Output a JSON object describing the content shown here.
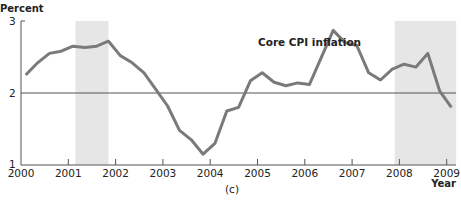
{
  "chart_data": {
    "type": "line",
    "title": "",
    "ylabel": "Percent",
    "xlabel": "Year",
    "caption": "(c)",
    "annotation": "Core CPI inflation",
    "ylim": [
      1,
      3
    ],
    "xlim": [
      2000,
      2009.2
    ],
    "yticks": [
      1,
      2,
      3
    ],
    "xticks": [
      2000,
      2001,
      2002,
      2003,
      2004,
      2005,
      2006,
      2007,
      2008,
      2009
    ],
    "reference_line": 2,
    "shaded_regions": [
      {
        "start": 2001.15,
        "end": 2001.85
      },
      {
        "start": 2007.9,
        "end": 2009.2
      }
    ],
    "colors": {
      "line": "#7a7a7a",
      "shade": "#e6e6e6",
      "axis": "#555555",
      "refline": "#555555"
    },
    "series": [
      {
        "name": "Core CPI inflation",
        "x": [
          2000.1,
          2000.35,
          2000.6,
          2000.85,
          2001.1,
          2001.35,
          2001.6,
          2001.85,
          2002.1,
          2002.35,
          2002.6,
          2002.85,
          2003.1,
          2003.35,
          2003.6,
          2003.85,
          2004.1,
          2004.35,
          2004.6,
          2004.85,
          2005.1,
          2005.35,
          2005.6,
          2005.85,
          2006.1,
          2006.6,
          2006.85,
          2007.1,
          2007.35,
          2007.6,
          2007.85,
          2008.1,
          2008.35,
          2008.6,
          2008.85,
          2009.1
        ],
        "values": [
          2.25,
          2.42,
          2.55,
          2.58,
          2.65,
          2.63,
          2.65,
          2.72,
          2.52,
          2.42,
          2.28,
          2.05,
          1.82,
          1.48,
          1.35,
          1.15,
          1.3,
          1.75,
          1.8,
          2.17,
          2.28,
          2.15,
          2.1,
          2.14,
          2.12,
          2.87,
          2.7,
          2.66,
          2.28,
          2.18,
          2.33,
          2.4,
          2.36,
          2.55,
          2.03,
          1.8
        ]
      }
    ]
  },
  "labels": {
    "ylabel": "Percent",
    "xlabel": "Year",
    "caption": "(c)",
    "annotation": "Core CPI inflation",
    "ytick_1": "1",
    "ytick_2": "2",
    "ytick_3": "3",
    "xticks": [
      "2000",
      "2001",
      "2002",
      "2003",
      "2004",
      "2005",
      "2006",
      "2007",
      "2008",
      "2009"
    ]
  }
}
